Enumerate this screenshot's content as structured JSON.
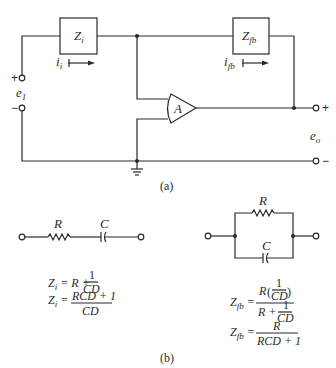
{
  "figure": {
    "part_a": {
      "caption": "(a)",
      "input_impedance": {
        "symbol": "Z",
        "subscript": "i"
      },
      "feedback_impedance": {
        "symbol": "Z",
        "subscript": "fb"
      },
      "input_current": {
        "symbol": "i",
        "subscript": "i"
      },
      "feedback_current": {
        "symbol": "i",
        "subscript": "fb"
      },
      "amplifier_label": "A",
      "input_voltage": {
        "symbol": "e",
        "subscript": "1",
        "plus": "+",
        "minus": "−"
      },
      "output_voltage": {
        "symbol": "e",
        "subscript": "o",
        "plus": "+",
        "minus": "−"
      }
    },
    "part_b": {
      "caption": "(b)",
      "series_network": {
        "resistor_label": "R",
        "capacitor_label": "C",
        "equations": [
          {
            "lhs_symbol": "Z",
            "lhs_sub": "i",
            "rhs_text": "R + ",
            "num": "1",
            "den": "CD"
          },
          {
            "lhs_symbol": "Z",
            "lhs_sub": "i",
            "num": "RCD + 1",
            "den": "CD"
          }
        ]
      },
      "parallel_network": {
        "resistor_label": "R",
        "capacitor_label": "C",
        "equations": [
          {
            "lhs_symbol": "Z",
            "lhs_sub": "fb",
            "num_prefix": "R",
            "num_inner_num": "1",
            "num_inner_den": "CD",
            "den_prefix": "R + ",
            "den_inner_num": "1",
            "den_inner_den": "CD"
          },
          {
            "lhs_symbol": "Z",
            "lhs_sub": "fb",
            "num": "R",
            "den": "RCD + 1"
          }
        ]
      }
    }
  }
}
